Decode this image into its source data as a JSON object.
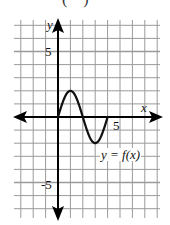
{
  "caption": "( )",
  "chart_data": {
    "type": "line",
    "title": "",
    "xlabel": "x",
    "ylabel": "y",
    "curve_label": "y = f(x)",
    "xlim": [
      -3,
      8
    ],
    "ylim": [
      -7,
      7
    ],
    "grid": true,
    "tick_labels": {
      "x": [
        "5"
      ],
      "y": [
        "5",
        "-5"
      ]
    },
    "series": [
      {
        "name": "y = f(x)",
        "x": [
          0,
          0.5,
          1,
          1.5,
          2,
          2.5,
          3,
          3.5,
          4
        ],
        "y": [
          0,
          1.41,
          2,
          1.41,
          0,
          -1.41,
          -2,
          -1.41,
          0
        ]
      }
    ],
    "key_points": [
      {
        "x": 0,
        "y": 0
      },
      {
        "x": 1,
        "y": 2
      },
      {
        "x": 2,
        "y": 0
      },
      {
        "x": 3,
        "y": -2
      },
      {
        "x": 4,
        "y": 0
      }
    ]
  },
  "labels": {
    "x_axis": "x",
    "y_axis": "y",
    "x_tick_5": "5",
    "y_tick_5": "5",
    "y_tick_neg5": "-5",
    "curve": "y = f(x)"
  },
  "colors": {
    "grid": "#9a9a9a",
    "axis": "#000000",
    "curve": "#111111",
    "background": "#ffffff"
  }
}
